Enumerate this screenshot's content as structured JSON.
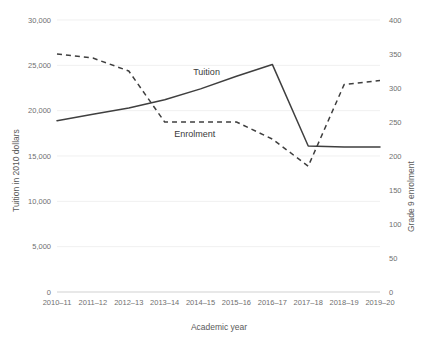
{
  "chart_data": {
    "type": "line",
    "title": "",
    "xlabel": "Academic year",
    "ylabel": "Tuition in 2010 dollars",
    "y2label": "Grade 9 enrolment",
    "categories": [
      "2010–11",
      "2011–12",
      "2012–13",
      "2013–14",
      "2014–15",
      "2015–16",
      "2016–17",
      "2017–18",
      "2018–19",
      "2019–20"
    ],
    "ylim": [
      0,
      30000
    ],
    "y2lim": [
      0,
      400
    ],
    "yticks": [
      "0",
      "5,000",
      "10,000",
      "15,000",
      "20,000",
      "25,000",
      "30,000"
    ],
    "ytick_values": [
      0,
      5000,
      10000,
      15000,
      20000,
      25000,
      30000
    ],
    "y2ticks": [
      "0",
      "50",
      "100",
      "150",
      "200",
      "250",
      "300",
      "350",
      "400"
    ],
    "y2tick_values": [
      0,
      50,
      100,
      150,
      200,
      250,
      300,
      350,
      400
    ],
    "grid": true,
    "legend_position": "inline-annotations",
    "series": [
      {
        "name": "Tuition",
        "axis": "left",
        "style": "solid",
        "color": "#3f3f3f",
        "values": [
          18900,
          19600,
          20300,
          21200,
          22400,
          23800,
          25100,
          16100,
          16000,
          16000
        ]
      },
      {
        "name": "Enrolment",
        "axis": "right",
        "style": "dashed",
        "color": "#3f3f3f",
        "values": [
          350,
          344,
          325,
          250,
          250,
          250,
          225,
          185,
          305,
          311
        ]
      }
    ],
    "annotations": [
      {
        "text": "Tuition",
        "x_category": "2014–15",
        "note": "label above solid line"
      },
      {
        "text": "Enrolment",
        "x_category": "2013–14",
        "note": "label below dashed plateau"
      }
    ]
  }
}
